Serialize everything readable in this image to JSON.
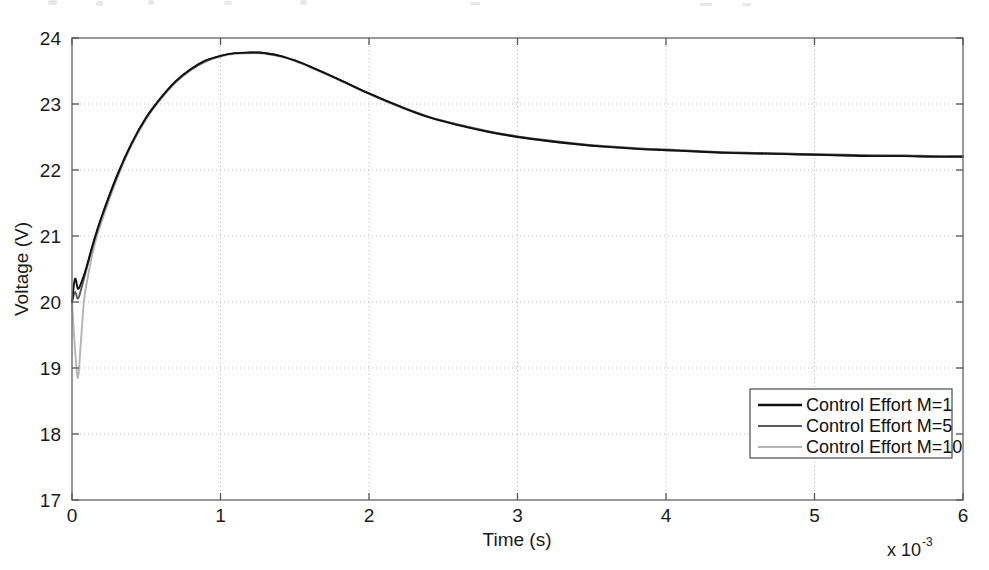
{
  "figure": {
    "background_color": "#ffffff",
    "axes_color": "#666666",
    "grid_color": "#bbbbbb",
    "text_color": "#1a1a1a"
  },
  "axis": {
    "x_title": "Time (s)",
    "y_title": "Voltage (V)",
    "x_exponent_prefix": "x 10",
    "x_exponent_power": "-3",
    "x_ticks": [
      "0",
      "1",
      "2",
      "3",
      "4",
      "5",
      "6"
    ],
    "y_ticks": [
      "17",
      "18",
      "19",
      "20",
      "21",
      "22",
      "23",
      "24"
    ]
  },
  "legend": {
    "position": "bottom-right",
    "items": [
      {
        "label": "Control Effort M=1",
        "color": "#101010"
      },
      {
        "label": "Control Effort M=5",
        "color": "#5a5a5a"
      },
      {
        "label": "Control Effort M=10",
        "color": "#b4b4b4"
      }
    ]
  },
  "chart_data": {
    "type": "line",
    "title": "",
    "xlabel": "Time (s)",
    "ylabel": "Voltage (V)",
    "xlim": [
      0,
      6
    ],
    "ylim": [
      17,
      24
    ],
    "x_scale_factor": "1e-3",
    "x_tick_values": [
      0,
      1,
      2,
      3,
      4,
      5,
      6
    ],
    "y_tick_values": [
      17,
      18,
      19,
      20,
      21,
      22,
      23,
      24
    ],
    "grid": true,
    "legend_position": "lower right",
    "x": [
      0,
      0.02,
      0.04,
      0.06,
      0.08,
      0.1,
      0.15,
      0.2,
      0.3,
      0.4,
      0.5,
      0.6,
      0.7,
      0.8,
      0.9,
      1.0,
      1.1,
      1.2,
      1.25,
      1.3,
      1.4,
      1.5,
      1.6,
      1.8,
      2.0,
      2.2,
      2.4,
      2.6,
      2.8,
      3.0,
      3.2,
      3.4,
      3.6,
      3.8,
      4.0,
      4.2,
      4.4,
      4.6,
      4.8,
      5.0,
      5.2,
      5.4,
      5.6,
      5.8,
      6.0
    ],
    "series": [
      {
        "name": "Control Effort M=1",
        "color": "#101010",
        "values": [
          20.0,
          20.35,
          20.2,
          20.28,
          20.4,
          20.55,
          20.95,
          21.3,
          21.9,
          22.4,
          22.8,
          23.1,
          23.35,
          23.53,
          23.66,
          23.73,
          23.77,
          23.78,
          23.78,
          23.77,
          23.73,
          23.66,
          23.57,
          23.37,
          23.16,
          22.97,
          22.8,
          22.68,
          22.58,
          22.5,
          22.44,
          22.39,
          22.35,
          22.32,
          22.3,
          22.28,
          22.26,
          22.25,
          22.24,
          22.23,
          22.22,
          22.21,
          22.21,
          22.2,
          22.2
        ]
      },
      {
        "name": "Control Effort M=5",
        "color": "#5a5a5a",
        "values": [
          20.0,
          20.15,
          20.05,
          20.18,
          20.35,
          20.52,
          20.93,
          21.28,
          21.88,
          22.39,
          22.79,
          23.09,
          23.34,
          23.52,
          23.65,
          23.73,
          23.77,
          23.78,
          23.78,
          23.77,
          23.73,
          23.66,
          23.57,
          23.37,
          23.16,
          22.97,
          22.81,
          22.69,
          22.59,
          22.51,
          22.45,
          22.4,
          22.36,
          22.33,
          22.31,
          22.29,
          22.27,
          22.26,
          22.25,
          22.24,
          22.23,
          22.22,
          22.22,
          22.21,
          22.21
        ]
      },
      {
        "name": "Control Effort M=10",
        "color": "#b4b4b4",
        "values": [
          20.0,
          19.3,
          18.85,
          19.4,
          20.0,
          20.3,
          20.85,
          21.22,
          21.85,
          22.37,
          22.77,
          23.08,
          23.33,
          23.51,
          23.64,
          23.72,
          23.76,
          23.77,
          23.77,
          23.76,
          23.72,
          23.65,
          23.56,
          23.36,
          23.15,
          22.96,
          22.8,
          22.68,
          22.58,
          22.5,
          22.44,
          22.39,
          22.35,
          22.32,
          22.3,
          22.28,
          22.26,
          22.25,
          22.24,
          22.23,
          22.22,
          22.22,
          22.21,
          22.21,
          22.2
        ]
      }
    ]
  }
}
